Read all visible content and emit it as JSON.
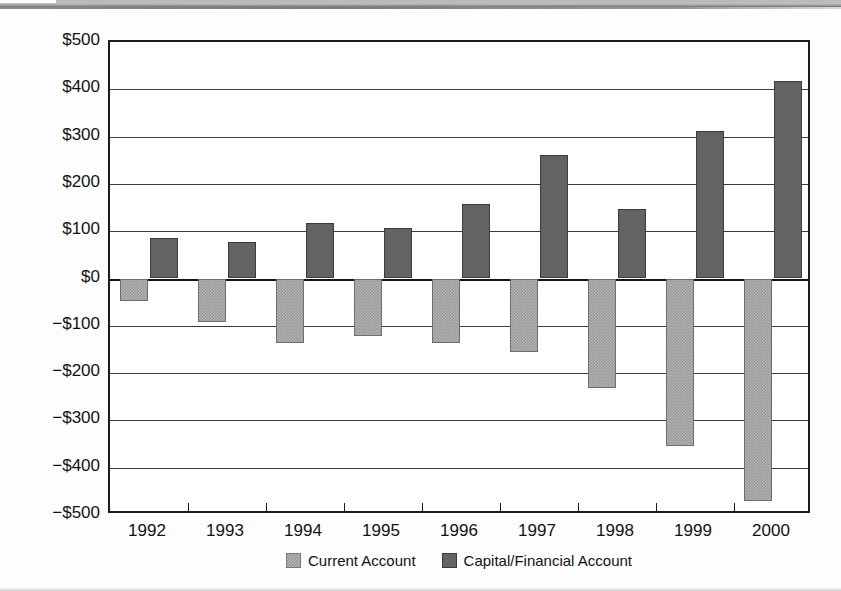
{
  "banner": {
    "title": "",
    "note": "cut-off title banner at top of scanned figure"
  },
  "chart_data": {
    "type": "bar",
    "title": "",
    "xlabel": "",
    "ylabel": "",
    "ylim": [
      -500,
      500
    ],
    "ytick_step": 100,
    "grid": true,
    "legend_position": "bottom-center",
    "categories": [
      "1992",
      "1993",
      "1994",
      "1995",
      "1996",
      "1997",
      "1998",
      "1999",
      "2000"
    ],
    "ytick_labels": [
      "$500",
      "$400",
      "$300",
      "$200",
      "$100",
      "$0",
      "−$100",
      "−$200",
      "−$300",
      "−$400",
      "−$500"
    ],
    "ytick_values": [
      500,
      400,
      300,
      200,
      100,
      0,
      -100,
      -200,
      -300,
      -400,
      -500
    ],
    "series": [
      {
        "name": "Current Account",
        "color": "#9a9a9a",
        "values": [
          -48,
          -92,
          -136,
          -122,
          -136,
          -155,
          -232,
          -355,
          -470
        ]
      },
      {
        "name": "Capital/Financial Account",
        "color": "#636363",
        "values": [
          85,
          77,
          118,
          107,
          157,
          262,
          147,
          312,
          417
        ]
      }
    ]
  }
}
